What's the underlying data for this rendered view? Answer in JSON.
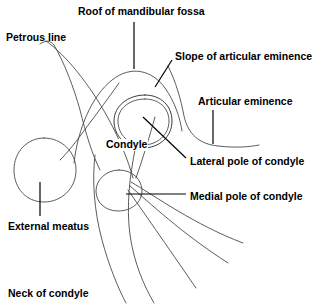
{
  "diagram": {
    "background_color": "#ffffff",
    "line_color": "#4a4a4a",
    "leader_color": "#000000",
    "text_color": "#000000",
    "labels": [
      {
        "id": "petrous-line",
        "text": "Petrous line",
        "x": 6,
        "y": 32
      },
      {
        "id": "roof-of-mandibular-fossa",
        "text": "Roof of mandibular fossa",
        "x": 78,
        "y": 6
      },
      {
        "id": "slope-of-articular-eminence",
        "text": "Slope of articular eminence",
        "x": 175,
        "y": 51
      },
      {
        "id": "articular-eminence",
        "text": "Articular eminence",
        "x": 198,
        "y": 96
      },
      {
        "id": "condyle",
        "text": "Condyle",
        "x": 105,
        "y": 139
      },
      {
        "id": "lateral-pole-of-condyle",
        "text": "Lateral pole of condyle",
        "x": 190,
        "y": 156
      },
      {
        "id": "medial-pole-of-condyle",
        "text": "Medial pole of condyle",
        "x": 190,
        "y": 191
      },
      {
        "id": "external-meatus",
        "text": "External meatus",
        "x": 8,
        "y": 221
      },
      {
        "id": "neck-of-condyle",
        "text": "Neck of condyle",
        "x": 8,
        "y": 288
      }
    ],
    "structures": [
      {
        "id": "petrous-line-upper",
        "name": "petrous ridge line (upper)"
      },
      {
        "id": "petrous-line-lower",
        "name": "petrous ridge line (lower)"
      },
      {
        "id": "mandibular-fossa-arch",
        "name": "roof of mandibular fossa arch"
      },
      {
        "id": "articular-eminence-slope",
        "name": "articular eminence slope"
      },
      {
        "id": "condyle-outline",
        "name": "condyle head oval"
      },
      {
        "id": "condyle-inner",
        "name": "condyle inner oval"
      },
      {
        "id": "medial-pole-circle",
        "name": "medial pole circle"
      },
      {
        "id": "external-meatus-circle",
        "name": "external auditory meatus circle"
      },
      {
        "id": "condylar-neck-left",
        "name": "condylar neck left border"
      },
      {
        "id": "condylar-neck-right",
        "name": "condylar neck right border"
      },
      {
        "id": "ramus-line-1",
        "name": "fanned ramus line 1"
      },
      {
        "id": "ramus-line-2",
        "name": "fanned ramus line 2"
      },
      {
        "id": "ramus-line-3",
        "name": "fanned ramus line 3"
      }
    ]
  }
}
